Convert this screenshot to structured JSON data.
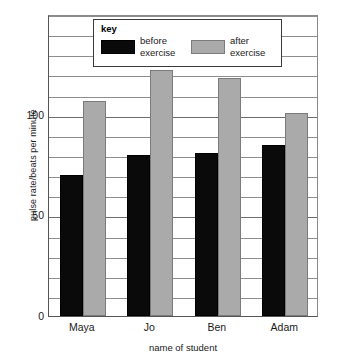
{
  "chart_data": {
    "type": "bar",
    "title": "",
    "categories": [
      "Maya",
      "Jo",
      "Ben",
      "Adam"
    ],
    "series": [
      {
        "name": "before exercise",
        "values": [
          70,
          80,
          81,
          85
        ],
        "color": "#0a0a0a"
      },
      {
        "name": "after exercise",
        "values": [
          107,
          122,
          118,
          101
        ],
        "color": "#aaaaaa"
      }
    ],
    "xlabel": "name of student",
    "ylabel": "pulse rate/beats per minute",
    "ylim": [
      0,
      150
    ],
    "ytick_labels": [
      "0",
      "50",
      "100"
    ],
    "ytick_values": [
      0,
      50,
      100
    ],
    "minor_tick_step": 10,
    "grid": true,
    "legend_position": "top-center"
  },
  "legend": {
    "title": "key",
    "entries": [
      {
        "label_line1": "before",
        "label_line2": "exercise",
        "swatch": "before"
      },
      {
        "label_line1": "after",
        "label_line2": "exercise",
        "swatch": "after"
      }
    ]
  },
  "axes": {
    "y_title": "pulse rate/beats per minute",
    "x_title": "name of student"
  }
}
